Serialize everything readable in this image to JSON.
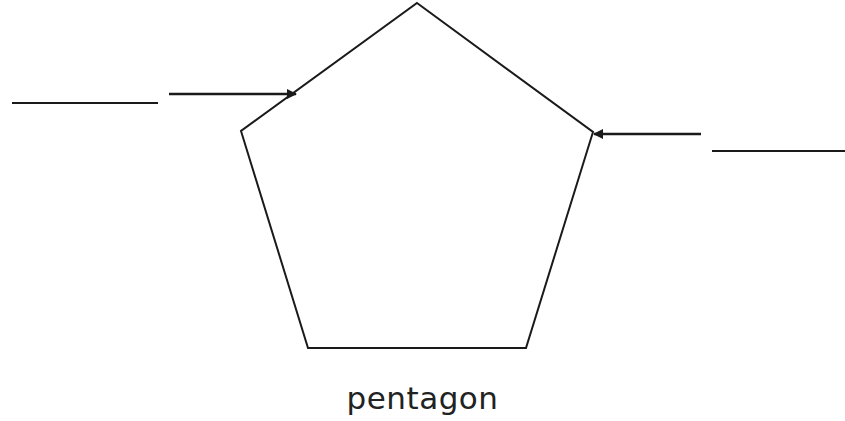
{
  "diagram": {
    "shape_name": "pentagon",
    "stroke_color": "#1a1a1a",
    "background": "#ffffff",
    "pentagon_points": "417,3 593,132 526,348 308,348 241,131",
    "labels": [
      {
        "id": "left",
        "blank_line": {
          "x1": 12,
          "y1": 103,
          "x2": 158,
          "y2": 103
        },
        "arrow": {
          "x1": 169,
          "y1": 94,
          "x2": 296,
          "y2": 94
        },
        "points_to": "upper-left edge"
      },
      {
        "id": "right",
        "blank_line": {
          "x1": 712,
          "y1": 151,
          "x2": 845,
          "y2": 151
        },
        "arrow": {
          "x1": 701,
          "y1": 134,
          "x2": 593,
          "y2": 134
        },
        "points_to": "right vertex"
      }
    ]
  }
}
